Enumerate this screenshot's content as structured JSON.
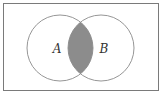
{
  "diagram": {
    "type": "venn",
    "universe": {
      "x": 3,
      "y": 3,
      "width": 156,
      "height": 88
    },
    "sets": [
      {
        "label": "A",
        "cx": 60,
        "cy": 48,
        "r": 33,
        "label_x": 57,
        "label_y": 53
      },
      {
        "label": "B",
        "cx": 101,
        "cy": 48,
        "r": 33,
        "label_x": 104,
        "label_y": 53
      }
    ],
    "shaded_region": "A ∩ B",
    "colors": {
      "stroke": "#8a8a8a",
      "frame": "#7a7a7a",
      "shade": "#8c8c8c",
      "label": "#333333"
    }
  }
}
